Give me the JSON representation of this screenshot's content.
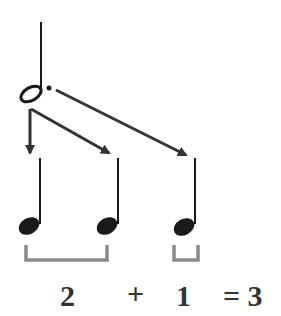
{
  "diagram": {
    "source_note": {
      "type": "dotted-half-note"
    },
    "target_notes": [
      {
        "type": "quarter-note",
        "group": 1
      },
      {
        "type": "quarter-note",
        "group": 1
      },
      {
        "type": "quarter-note",
        "group": 2
      }
    ],
    "equation": {
      "term1": "2",
      "plus": "+",
      "term2": "1",
      "result": "= 3"
    },
    "colors": {
      "ink": "#1a1a1a",
      "arrow": "#333333",
      "bracket": "#8a8a8a",
      "text": "#333333"
    }
  }
}
